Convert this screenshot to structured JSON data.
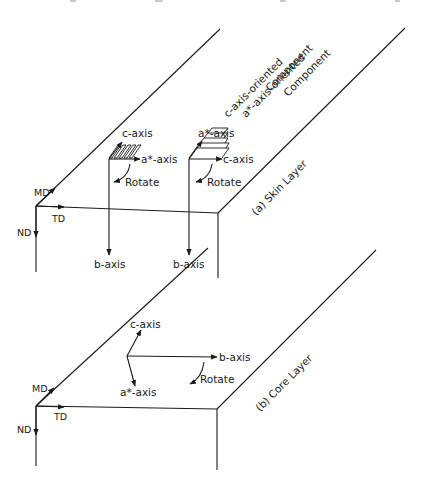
{
  "figure": {
    "top_panel": {
      "id": "a",
      "label": "(a) Skin Layer",
      "sample_axes": {
        "md": "MD",
        "td": "TD",
        "nd": "ND"
      },
      "components": [
        {
          "title_line1": "c-axis-oriented",
          "title_line2": "Component",
          "up_axis": "c-axis",
          "right_axis": "a*-axis",
          "down_axis": "b-axis",
          "rotate": "Rotate"
        },
        {
          "title_line1": "a*-axis-oriented",
          "title_line2": "Component",
          "up_axis": "a*-axis",
          "right_axis": "c-axis",
          "down_axis": "b-axis",
          "rotate": "Rotate"
        }
      ]
    },
    "bottom_panel": {
      "id": "b",
      "label": "(b) Core Layer",
      "sample_axes": {
        "md": "MD",
        "td": "TD",
        "nd": "ND"
      },
      "crystal_axes": {
        "c": "c-axis",
        "b": "b-axis",
        "a": "a*-axis",
        "rotate": "Rotate"
      }
    }
  },
  "colors": {
    "ink": "#1a1a1a",
    "background": "#ffffff"
  }
}
